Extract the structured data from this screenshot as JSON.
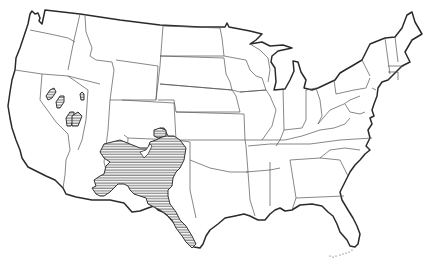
{
  "map": {
    "type": "outline map",
    "region": "Contiguous United States",
    "boundaries": "state lines",
    "range_fill": "horizontal hatching",
    "colors": {
      "background": "#ffffff",
      "outline": "#2a2a2a",
      "state_lines": "#555555",
      "hatch": "#333333"
    },
    "highlighted_regions": [
      {
        "name": "main-range",
        "area": "SE Arizona, New Mexico, west Texas, Rio Grande valley"
      },
      {
        "name": "nevada-patches",
        "area": "south-central Nevada (3 small patches)"
      },
      {
        "name": "utah-patch",
        "area": "western Utah (small patch)"
      }
    ]
  }
}
